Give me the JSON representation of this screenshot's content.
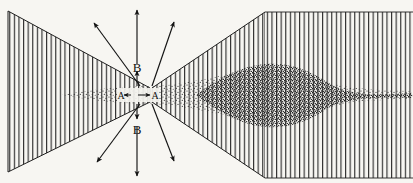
{
  "figure": {
    "background_color": "#f7f6f2",
    "ink_color": "#1a1a1a",
    "canvas": {
      "width": 413,
      "height": 183
    }
  },
  "labels": {
    "axial_left": "A",
    "axial_right": "A",
    "transverse_top": "B",
    "transverse_bottom": "B"
  },
  "regions": [
    {
      "name": "left-cone",
      "description": "left hatched trapezoid converging toward centre waist",
      "hatch": "vertical-lines",
      "hatch_color": "#2b2b2b"
    },
    {
      "name": "right-cone",
      "description": "right hatched cone diverging from centre waist to full height",
      "hatch": "vertical-lines",
      "hatch_color": "#2b2b2b"
    },
    {
      "name": "right-block",
      "description": "full height vertical hatched block at right side",
      "hatch": "vertical-lines",
      "hatch_color": "#2b2b2b"
    },
    {
      "name": "central-beam",
      "description": "horizontal stippled beam along the axis",
      "fill": "stipple"
    },
    {
      "name": "dark-lobe",
      "description": "dense lens shaped stippled lobe right of centre",
      "fill": "dense-stipple"
    }
  ],
  "arrows": {
    "axial": {
      "name": "A-A double headed arrow",
      "style": "double-headed",
      "orientation": "horizontal"
    },
    "transverse_top": {
      "name": "B upward double headed arrow",
      "style": "double-headed",
      "orientation": "vertical"
    },
    "transverse_bottom": {
      "name": "B downward double headed arrow",
      "style": "double-headed",
      "orientation": "vertical"
    },
    "radial": [
      {
        "name": "upper-left-ray",
        "direction": "up-left"
      },
      {
        "name": "upper-right-ray",
        "direction": "up-right"
      },
      {
        "name": "lower-left-ray",
        "direction": "down-left"
      },
      {
        "name": "lower-right-ray",
        "direction": "down-right"
      }
    ]
  }
}
